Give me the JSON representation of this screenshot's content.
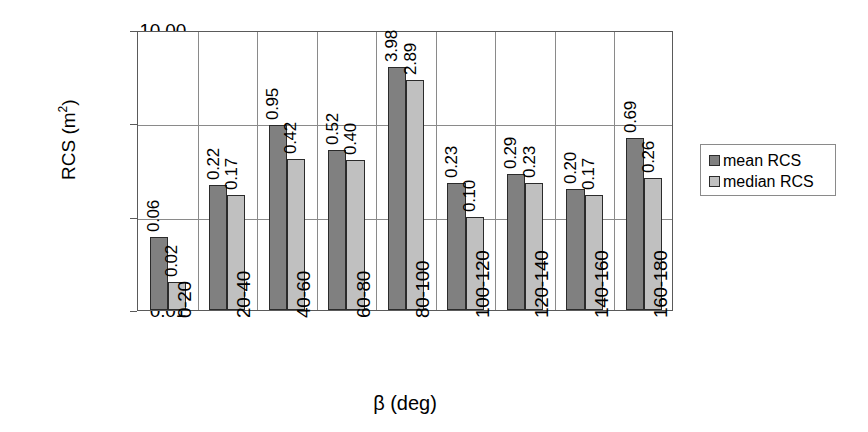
{
  "chart_data": {
    "type": "bar",
    "title": "",
    "xlabel": "β (deg)",
    "ylabel": "RCS (m²)",
    "yscale": "log",
    "ylim": [
      0.01,
      10.0
    ],
    "ytick_labels": [
      "0.01",
      "0.10",
      "1.00",
      "10.00"
    ],
    "ytick_values": [
      0.01,
      0.1,
      1.0,
      10.0
    ],
    "grid": true,
    "legend_position": "right",
    "categories": [
      "0-20",
      "20-40",
      "40-60",
      "60-80",
      "80-100",
      "100-120",
      "120-140",
      "140-160",
      "160-180"
    ],
    "series": [
      {
        "name": "mean RCS",
        "color": "#808080",
        "values": [
          0.06,
          0.22,
          0.95,
          0.52,
          3.98,
          0.23,
          0.29,
          0.2,
          0.69
        ],
        "labels": [
          "0.06",
          "0.22",
          "0.95",
          "0.52",
          "3.98",
          "0.23",
          "0.29",
          "0.20",
          "0.69"
        ]
      },
      {
        "name": "median RCS",
        "color": "#c0c0c0",
        "values": [
          0.02,
          0.17,
          0.42,
          0.4,
          2.89,
          0.1,
          0.23,
          0.17,
          0.26
        ],
        "labels": [
          "0.02",
          "0.17",
          "0.42",
          "0.40",
          "2.89",
          "0.10",
          "0.23",
          "0.17",
          "0.26"
        ]
      }
    ]
  },
  "legend": {
    "items": [
      {
        "label": "mean RCS",
        "swatch": "mean"
      },
      {
        "label": "median RCS",
        "swatch": "median"
      }
    ]
  },
  "axis": {
    "y_title_main": "RCS (m",
    "y_title_sup": "2",
    "y_title_tail": ")",
    "x_title": "β (deg)"
  }
}
